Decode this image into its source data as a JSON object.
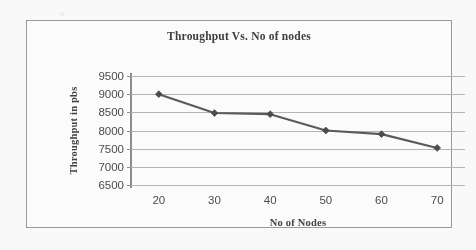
{
  "chart_data": {
    "type": "line",
    "title": "Throughput Vs. No of nodes",
    "xlabel": "No of Nodes",
    "ylabel": "Throughput in pbs",
    "x": [
      20,
      30,
      40,
      50,
      60,
      70
    ],
    "categories": [
      "20",
      "30",
      "40",
      "50",
      "60",
      "70"
    ],
    "values": [
      9000,
      8480,
      8450,
      8000,
      7900,
      7520
    ],
    "series": [
      {
        "name": "Throughput",
        "values": [
          9000,
          8480,
          8450,
          8000,
          7900,
          7520
        ]
      }
    ],
    "xlim": [
      15,
      75
    ],
    "ylim": [
      6500,
      9500
    ],
    "yticks": [
      9500,
      9000,
      8500,
      8000,
      7500,
      7000,
      6500
    ],
    "ytick_labels": [
      "9500",
      "9000",
      "8500",
      "8000",
      "7500",
      "7000",
      "6500"
    ],
    "xticks": [
      20,
      30,
      40,
      50,
      60,
      70
    ],
    "xtick_labels": [
      "20",
      "30",
      "40",
      "50",
      "60",
      "70"
    ],
    "grid": "horizontal",
    "legend": "none",
    "marker": "diamond",
    "line_color": "#595959",
    "marker_color": "#4a4a4a",
    "gridline_color": "#b6b6b6",
    "axis_color": "#8c8c8c",
    "border_color": "#9a9a9a",
    "background": "#ffffff"
  }
}
